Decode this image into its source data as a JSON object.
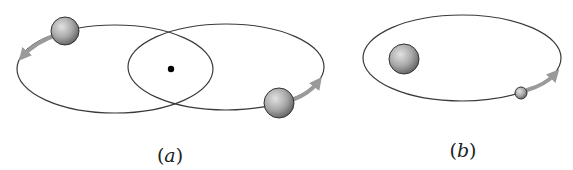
{
  "figure": {
    "panels": [
      {
        "id": "a",
        "label": "(a)",
        "label_letter": "a",
        "description": "Two equal-mass bodies orbiting a common center of mass on overlapping elliptical orbits",
        "center_of_mass": {
          "x": 171,
          "y": 69
        },
        "orbits": [
          {
            "cx": 115,
            "cy": 69,
            "rx": 98,
            "ry": 44
          },
          {
            "cx": 226,
            "cy": 67,
            "rx": 98,
            "ry": 43
          }
        ],
        "bodies": [
          {
            "cx": 65,
            "cy": 31,
            "r": 14,
            "motion": "counterclockwise-left"
          },
          {
            "cx": 279,
            "cy": 103,
            "r": 15,
            "motion": "counterclockwise-right"
          }
        ]
      },
      {
        "id": "b",
        "label": "(b)",
        "label_letter": "b",
        "description": "Small body orbiting a much larger body on an elliptical orbit",
        "orbits": [
          {
            "cx": 462,
            "cy": 58,
            "rx": 99,
            "ry": 43
          }
        ],
        "bodies": [
          {
            "cx": 404,
            "cy": 59,
            "r": 15,
            "role": "large-body"
          },
          {
            "cx": 521,
            "cy": 93,
            "r": 6,
            "role": "small-body",
            "motion": "counterclockwise"
          }
        ]
      }
    ],
    "colors": {
      "orbit_stroke": "#3a3a3a",
      "arrow": "#9a9a9a",
      "sphere_light": "#d8d8d8",
      "sphere_dark": "#6e6e6e",
      "sphere_outline": "#333333",
      "dot": "#000000"
    }
  }
}
